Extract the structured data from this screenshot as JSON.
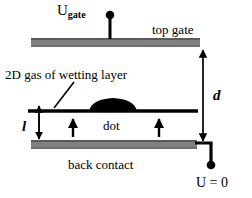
{
  "figure": {
    "title_present": false,
    "background_color": "#ffffff",
    "ink_color": "#000000",
    "electrode_color": "#808080",
    "electrode_edge_color": "#5a5a5a"
  },
  "labels": {
    "gate_voltage_main": "U",
    "gate_voltage_sub": "gate",
    "top_gate": "top gate",
    "wetting_layer": "2D gas of wetting layer",
    "dot": "dot",
    "back_contact": "back contact",
    "ground_voltage": "U = 0",
    "distance_d": "d",
    "distance_l": "l"
  },
  "elements": {
    "top_gate_bar": {
      "x": 31,
      "y": 38,
      "width": 169,
      "height": 9
    },
    "back_contact_bar": {
      "x": 31,
      "y": 140,
      "width": 166,
      "height": 9
    },
    "wetting_layer_line": {
      "x1": 28,
      "y1": 111,
      "x2": 198,
      "y2": 111,
      "thickness": 3
    },
    "quantum_dot": {
      "cx": 113,
      "cy": 111,
      "rx": 24,
      "ry": 10
    },
    "gate_terminal_dot": {
      "cx": 110,
      "cy": 15,
      "r": 4
    },
    "gate_wire": {
      "x1": 110,
      "y1": 15,
      "x2": 110,
      "y2": 38
    },
    "ground_terminal_dot": {
      "cx": 211,
      "cy": 165,
      "r": 4
    },
    "ground_wire_horizontal": {
      "x1": 196,
      "y1": 143,
      "x2": 211,
      "y2": 143
    },
    "ground_wire_vertical": {
      "x1": 211,
      "y1": 143,
      "x2": 211,
      "y2": 165
    },
    "d_arrow": {
      "x": 203,
      "y1": 48,
      "y2": 142,
      "double_headed": true
    },
    "l_arrow": {
      "x": 39,
      "y1": 110,
      "y2": 140,
      "double_headed": true
    },
    "leader_line_wetting": {
      "x1": 72,
      "y1": 82,
      "x2": 53,
      "y2": 108
    },
    "growth_arrow_left": {
      "x": 73,
      "y1": 136,
      "y2": 118
    },
    "growth_arrow_right": {
      "x": 159,
      "y1": 136,
      "y2": 118
    }
  },
  "icon_names": {
    "terminal_dot": "filled-circle-terminal-icon",
    "arrow_double": "double-headed-arrow-icon",
    "arrow_up": "up-arrow-icon",
    "leader": "leader-line-icon"
  }
}
